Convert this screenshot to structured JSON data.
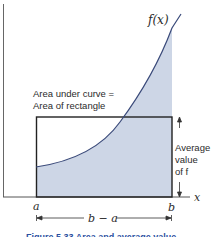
{
  "figure": {
    "function_label": "f(x)",
    "x_axis_label": "x",
    "left_bound_label": "a",
    "right_bound_label": "b",
    "width_label": "b − a",
    "annotation_lines": [
      "Area under curve =",
      "Area of rectangle"
    ],
    "average_lines": [
      "Average",
      "value",
      "of f"
    ],
    "caption": "Figure 5.33  Area and average value",
    "colors": {
      "shade": "#cdd6e6",
      "curve": "#3a4a7a",
      "axis": "#555555",
      "rect": "#222222",
      "caption": "#2a4fa0"
    }
  }
}
